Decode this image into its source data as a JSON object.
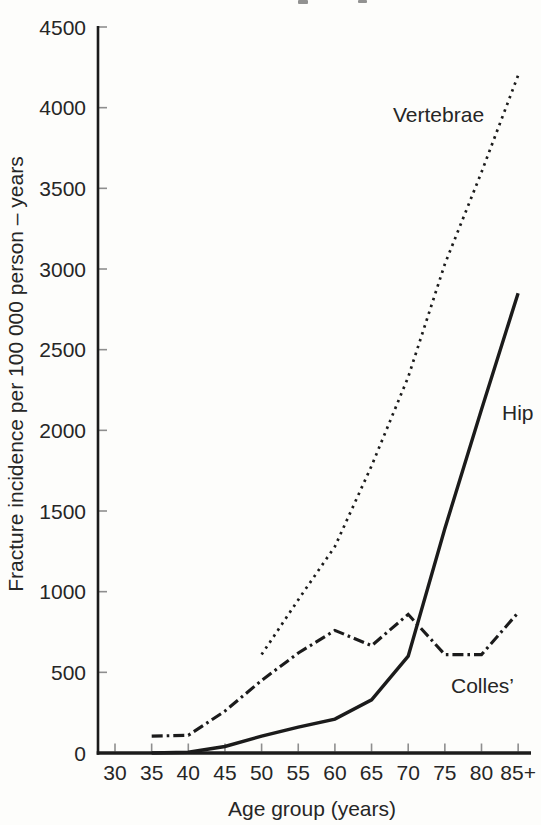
{
  "figure": {
    "kind": "scanned-book-chart",
    "cropped_top_text_remnants": true
  },
  "colors": {
    "ink": "#1b1b1b",
    "text": "#262626",
    "tick": "#8e8e8e",
    "background": "#fdfdfb"
  },
  "chart_data": {
    "type": "line",
    "title": "",
    "xlabel": "Age group (years)",
    "ylabel": "Fracture incidence per 100 000 person – years",
    "categories": [
      "30",
      "35",
      "40",
      "45",
      "50",
      "55",
      "60",
      "65",
      "70",
      "75",
      "80",
      "85+"
    ],
    "ylim": [
      0,
      4500
    ],
    "ytick_step": 500,
    "ytick_labels": [
      "0",
      "500",
      "1000",
      "1500",
      "2000",
      "2500",
      "3000",
      "3500",
      "4000",
      "4500"
    ],
    "grid": false,
    "legend_position": "inline-labels",
    "series": [
      {
        "name": "Vertebrae",
        "line_style": "dotted",
        "values": [
          null,
          null,
          null,
          null,
          610,
          950,
          1280,
          1780,
          2330,
          3030,
          3600,
          4200
        ]
      },
      {
        "name": "Hip",
        "line_style": "solid",
        "values": [
          null,
          0,
          5,
          40,
          105,
          160,
          210,
          330,
          600,
          1390,
          2130,
          2850
        ]
      },
      {
        "name": "Colles’",
        "line_style": "dashdot",
        "values": [
          null,
          105,
          110,
          260,
          450,
          620,
          760,
          665,
          860,
          610,
          610,
          870
        ]
      }
    ]
  }
}
